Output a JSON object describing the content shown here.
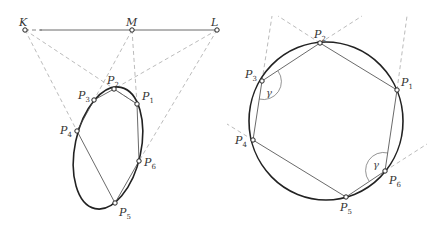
{
  "left_figure": {
    "description": "Pascal line construction: hexagon inscribed in an ellipse with intersection points K, M, L collinear",
    "collinear_points": [
      {
        "name": "K",
        "x": 25,
        "y": 30
      },
      {
        "name": "M",
        "x": 132,
        "y": 30
      },
      {
        "name": "L",
        "x": 217,
        "y": 30
      }
    ],
    "ellipse": {
      "cx": 108,
      "cy": 148,
      "rx": 33,
      "ry": 62,
      "rotation_deg": 12
    },
    "hexagon_points": [
      {
        "label": "P",
        "sub": "1",
        "x": 137,
        "y": 104,
        "lx": 142,
        "ly": 100
      },
      {
        "label": "P",
        "sub": "2",
        "x": 114,
        "y": 89,
        "lx": 107,
        "ly": 84
      },
      {
        "label": "P",
        "sub": "3",
        "x": 94,
        "y": 100,
        "lx": 78,
        "ly": 99
      },
      {
        "label": "P",
        "sub": "4",
        "x": 77,
        "y": 131,
        "lx": 60,
        "ly": 134
      },
      {
        "label": "P",
        "sub": "5",
        "x": 115,
        "y": 203,
        "lx": 119,
        "ly": 216
      },
      {
        "label": "P",
        "sub": "6",
        "x": 139,
        "y": 161,
        "lx": 144,
        "ly": 166
      }
    ],
    "labels": {
      "K": "K",
      "M": "M",
      "L": "L"
    }
  },
  "right_figure": {
    "description": "Hexagon inscribed in a circle with equal angles gamma at P3 and P6",
    "circle": {
      "cx": 326,
      "cy": 121,
      "rx": 77,
      "ry": 79
    },
    "hexagon_points": [
      {
        "label": "P",
        "sub": "1",
        "x": 397,
        "y": 90,
        "lx": 401,
        "ly": 86
      },
      {
        "label": "P",
        "sub": "2",
        "x": 320,
        "y": 43,
        "lx": 314,
        "ly": 38
      },
      {
        "label": "P",
        "sub": "3",
        "x": 262,
        "y": 81,
        "lx": 245,
        "ly": 78
      },
      {
        "label": "P",
        "sub": "4",
        "x": 253,
        "y": 140,
        "lx": 235,
        "ly": 144
      },
      {
        "label": "P",
        "sub": "5",
        "x": 346,
        "y": 197,
        "lx": 340,
        "ly": 211
      },
      {
        "label": "P",
        "sub": "6",
        "x": 385,
        "y": 171,
        "lx": 389,
        "ly": 184
      }
    ],
    "angle_label": "γ"
  }
}
